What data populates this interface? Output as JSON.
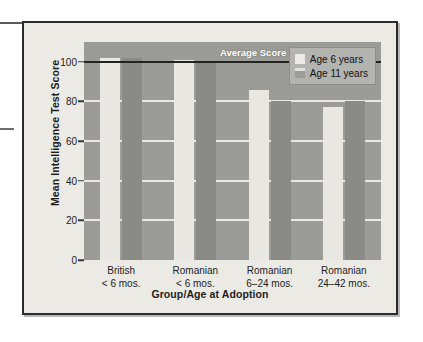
{
  "figure": {
    "y_axis_title": "Mean Intelligence Test Score",
    "x_axis_title": "Group/Age at Adoption",
    "average_line_label": "Average Score"
  },
  "legend": {
    "items": [
      {
        "label": "Age 6 years",
        "color": "#e9e7e1",
        "key": "age6"
      },
      {
        "label": "Age 11 years",
        "color": "#8a8a86",
        "key": "age11"
      }
    ]
  },
  "chart_data": {
    "type": "bar",
    "title": "",
    "xlabel": "Group/Age at Adoption",
    "ylabel": "Mean Intelligence Test Score",
    "ylim": [
      0,
      110
    ],
    "yticks": [
      0,
      20,
      40,
      60,
      80,
      100
    ],
    "ytick_labels": [
      "0",
      "20",
      "40",
      "60",
      "80",
      "100"
    ],
    "grid": true,
    "gridlines_at": [
      20,
      40,
      60,
      80
    ],
    "legend_position": "top-right",
    "categories": [
      "British\n< 6 mos.",
      "Romanian\n< 6 mos.",
      "Romanian\n6–24 mos.",
      "Romanian\n24–42 mos."
    ],
    "category_lines": [
      [
        "British",
        "< 6 mos."
      ],
      [
        "Romanian",
        "< 6 mos."
      ],
      [
        "Romanian",
        "6–24 mos."
      ],
      [
        "Romanian",
        "24–42 mos."
      ]
    ],
    "series": [
      {
        "name": "Age 6 years",
        "color": "#e9e7e1",
        "values": [
          102,
          101,
          86,
          77
        ]
      },
      {
        "name": "Age 11 years",
        "color": "#8a8a86",
        "values": [
          102,
          100,
          80,
          80
        ]
      }
    ],
    "annotations": [
      {
        "text": "Average Score",
        "type": "reference-line",
        "y": 100,
        "color": "#23231f"
      }
    ]
  }
}
